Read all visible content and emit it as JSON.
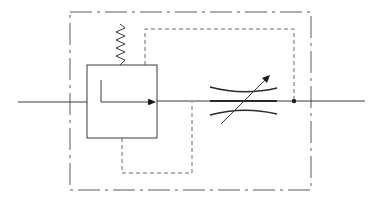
{
  "diagram": {
    "title": "Pressure-compensated flow control valve symbol",
    "type": "hydraulic schematic",
    "colors": {
      "line": "#3a3a3a",
      "pilot_line": "#6a6a6a",
      "enclosure": "#5a5a5a",
      "background": "#ffffff"
    },
    "components": [
      {
        "id": "inlet-line",
        "label": "Inlet flow line"
      },
      {
        "id": "outer-enclosure",
        "label": "Component enclosure (dash-dot)"
      },
      {
        "id": "compensator",
        "label": "Pressure compensator valve with spring"
      },
      {
        "id": "spring",
        "label": "Bias spring"
      },
      {
        "id": "pilot-line-upper",
        "label": "Pilot line from downstream"
      },
      {
        "id": "pilot-line-lower",
        "label": "Pilot line from intermediate pressure"
      },
      {
        "id": "throttle",
        "label": "Adjustable throttle (variable orifice)"
      },
      {
        "id": "junction",
        "label": "Junction point"
      },
      {
        "id": "outlet-line",
        "label": "Outlet flow line"
      }
    ]
  }
}
